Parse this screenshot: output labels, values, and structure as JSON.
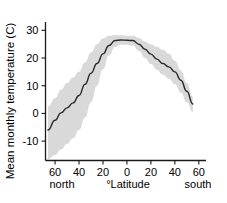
{
  "chart_data": {
    "type": "line",
    "title": "",
    "xlabel": "°Latitude",
    "ylabel": "Mean monthly temperature (C)",
    "x_axis": {
      "ticks": [
        -60,
        -40,
        -20,
        0,
        20,
        40,
        60
      ],
      "tick_labels": [
        "60",
        "40",
        "20",
        "0",
        "20",
        "40",
        "60"
      ],
      "range": [
        -68,
        66
      ],
      "left_annotation": "north",
      "right_annotation": "south",
      "grid": false
    },
    "y_axis": {
      "ticks": [
        -10,
        0,
        10,
        20,
        30
      ],
      "tick_labels": [
        "-10",
        "0",
        "10",
        "20",
        "30"
      ],
      "range": [
        -17,
        33
      ],
      "grid": false
    },
    "legend": {
      "visible": false,
      "entries": []
    },
    "series": [
      {
        "name": "Mean monthly temperature",
        "type": "line",
        "color": "#2b2b2b",
        "x": [
          -66,
          -60,
          -55,
          -50,
          -45,
          -40,
          -35,
          -30,
          -25,
          -20,
          -15,
          -10,
          -5,
          0,
          5,
          10,
          15,
          20,
          25,
          30,
          35,
          40,
          45,
          50,
          55
        ],
        "values": [
          -6.0,
          -2.5,
          0.2,
          2.0,
          3.8,
          6.5,
          10.5,
          14.5,
          18.0,
          21.5,
          24.5,
          26.3,
          26.5,
          26.4,
          26.3,
          25.0,
          23.2,
          21.4,
          19.6,
          18.0,
          16.8,
          15.0,
          12.0,
          8.0,
          3.4
        ]
      },
      {
        "name": "Variation band (upper bound)",
        "type": "band-upper",
        "color": "#d9d9d9",
        "x": [
          -66,
          -60,
          -55,
          -50,
          -45,
          -40,
          -35,
          -30,
          -25,
          -20,
          -15,
          -10,
          -5,
          0,
          5,
          10,
          15,
          20,
          25,
          30,
          35,
          40,
          45,
          50,
          55
        ],
        "values": [
          2.5,
          5.5,
          8.5,
          11.0,
          13.0,
          15.0,
          18.5,
          22.0,
          25.0,
          27.0,
          28.0,
          28.3,
          28.2,
          28.0,
          28.0,
          27.2,
          26.0,
          25.0,
          24.0,
          23.0,
          21.5,
          19.0,
          15.5,
          11.0,
          6.0
        ]
      },
      {
        "name": "Variation band (lower bound)",
        "type": "band-lower",
        "color": "#d9d9d9",
        "x": [
          -66,
          -60,
          -55,
          -50,
          -45,
          -40,
          -35,
          -30,
          -25,
          -20,
          -15,
          -10,
          -5,
          0,
          5,
          10,
          15,
          20,
          25,
          30,
          35,
          40,
          45,
          50,
          55
        ],
        "values": [
          -16.5,
          -15.0,
          -13.0,
          -11.0,
          -9.0,
          -6.0,
          -1.5,
          4.0,
          10.0,
          16.0,
          21.0,
          24.0,
          24.8,
          24.8,
          24.5,
          22.5,
          20.0,
          17.8,
          15.8,
          14.0,
          12.5,
          10.5,
          7.5,
          4.0,
          0.5
        ]
      }
    ],
    "colors": {
      "line": "#2b2b2b",
      "band": "#d9d9d9",
      "axis": "#1a1a1a",
      "background": "#ffffff",
      "text": "#000000"
    }
  }
}
